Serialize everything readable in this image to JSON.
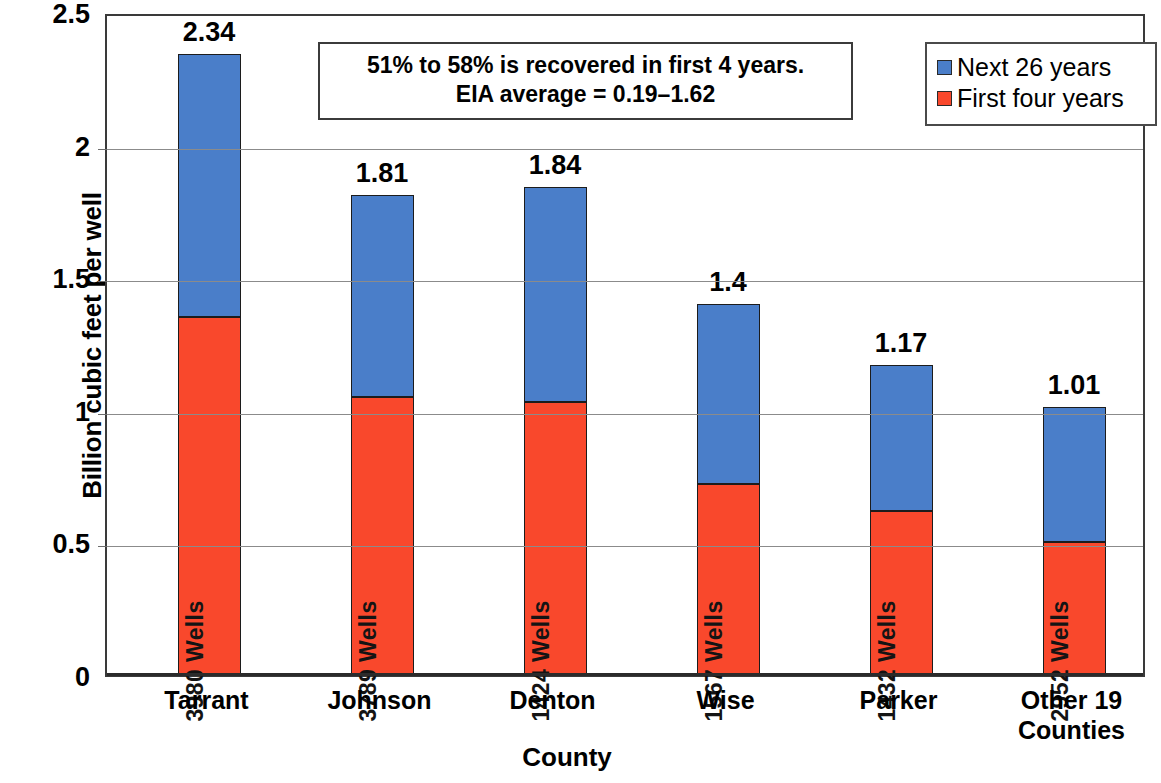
{
  "chart_data": {
    "type": "bar",
    "subtype": "stacked-column",
    "title": "",
    "xlabel": "County",
    "ylabel": "Billion cubic feet per well",
    "ylim": [
      0,
      2.5
    ],
    "yticks": [
      "0",
      "0.5",
      "1",
      "1.5",
      "2",
      "2.5"
    ],
    "ytick_values": [
      0,
      0.5,
      1,
      1.5,
      2,
      2.5
    ],
    "grid": true,
    "legend_position": "top-right",
    "categories": [
      "Tarrant",
      "Johnson",
      "Denton",
      "Wise",
      "Parker",
      "Other 19 Counties"
    ],
    "category_lines": [
      [
        "Tarrant"
      ],
      [
        "Johnson"
      ],
      [
        "Denton"
      ],
      [
        "Wise"
      ],
      [
        "Parker"
      ],
      [
        "Other 19",
        "Counties"
      ]
    ],
    "series": [
      {
        "name": "First four years",
        "color": "#f9482c",
        "values": [
          1.35,
          1.05,
          1.03,
          0.72,
          0.62,
          0.5
        ]
      },
      {
        "name": "Next 26 years",
        "color": "#4a7ec9",
        "values": [
          0.99,
          0.76,
          0.81,
          0.68,
          0.55,
          0.51
        ]
      }
    ],
    "totals": [
      2.34,
      1.81,
      1.84,
      1.4,
      1.17,
      1.01
    ],
    "total_labels": [
      "2.34",
      "1.81",
      "1.84",
      "1.4",
      "1.17",
      "1.01"
    ],
    "bar_annotations": [
      "3980 Wells",
      "3789 Wells",
      "1424 Wells",
      "1567 Wells",
      "1432 Wells",
      "2952 Wells"
    ],
    "annotation_box": {
      "line1": "51% to 58% is recovered in first 4 years.",
      "line2": "EIA average = 0.19–1.62"
    }
  },
  "legend": {
    "items": [
      {
        "label": "Next 26 years",
        "color": "#4a7ec9"
      },
      {
        "label": "First four years",
        "color": "#f9482c"
      }
    ]
  },
  "axes": {
    "y_title": "Billion cubic feet per well",
    "x_title": "County"
  }
}
